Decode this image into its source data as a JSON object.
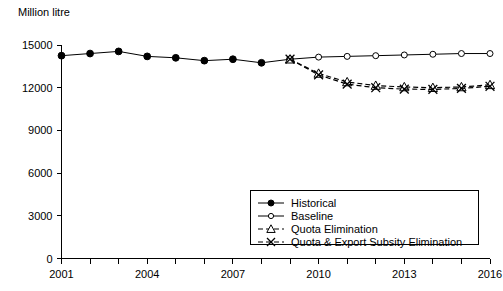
{
  "chart_data": {
    "type": "line",
    "title": "",
    "ylabel": "Million litre",
    "xlabel": "",
    "ylim": [
      0,
      15000
    ],
    "xlim": [
      2001,
      2016
    ],
    "grid": false,
    "legend_position": "bottom-right",
    "ytick_labels": [
      "0",
      "3000",
      "6000",
      "9000",
      "12000",
      "15000"
    ],
    "ytick_values": [
      0,
      3000,
      6000,
      9000,
      12000,
      15000
    ],
    "xtick_labels": [
      "2001",
      "2004",
      "2007",
      "2010",
      "2013",
      "2016"
    ],
    "xtick_values": [
      2001,
      2004,
      2007,
      2010,
      2013,
      2016
    ],
    "x": [
      2001,
      2002,
      2003,
      2004,
      2005,
      2006,
      2007,
      2008,
      2009,
      2010,
      2011,
      2012,
      2013,
      2014,
      2015,
      2016
    ],
    "series": [
      {
        "name": "Historical",
        "marker": "filled-circle",
        "line": "solid",
        "x": [
          2001,
          2002,
          2003,
          2004,
          2005,
          2006,
          2007,
          2008,
          2009
        ],
        "values": [
          14250,
          14400,
          14550,
          14200,
          14100,
          13900,
          14000,
          13750,
          14000
        ]
      },
      {
        "name": "Baseline",
        "marker": "open-circle",
        "line": "solid",
        "x": [
          2009,
          2010,
          2011,
          2012,
          2013,
          2014,
          2015,
          2016
        ],
        "values": [
          14000,
          14150,
          14200,
          14250,
          14300,
          14350,
          14400,
          14400
        ]
      },
      {
        "name": "Quota Elimination",
        "marker": "open-triangle",
        "line": "dashed",
        "x": [
          2009,
          2010,
          2011,
          2012,
          2013,
          2014,
          2015,
          2016
        ],
        "values": [
          14000,
          13000,
          12400,
          12150,
          12050,
          12000,
          12050,
          12200
        ]
      },
      {
        "name": "Quota & Export Subsity Elimination",
        "marker": "x",
        "line": "dashed",
        "x": [
          2009,
          2010,
          2011,
          2012,
          2013,
          2014,
          2015,
          2016
        ],
        "values": [
          14000,
          12900,
          12250,
          12000,
          11900,
          11880,
          11950,
          12100
        ]
      }
    ],
    "legend_entries": [
      {
        "label": "Historical",
        "marker": "filled-circle",
        "line": "solid"
      },
      {
        "label": "Baseline",
        "marker": "open-circle",
        "line": "solid"
      },
      {
        "label": "Quota Elimination",
        "marker": "open-triangle",
        "line": "dashed"
      },
      {
        "label": "Quota & Export Subsity Elimination",
        "marker": "x",
        "line": "dashed"
      }
    ],
    "colors": {
      "axis": "#000000",
      "series": "#000000",
      "background": "#ffffff"
    }
  }
}
